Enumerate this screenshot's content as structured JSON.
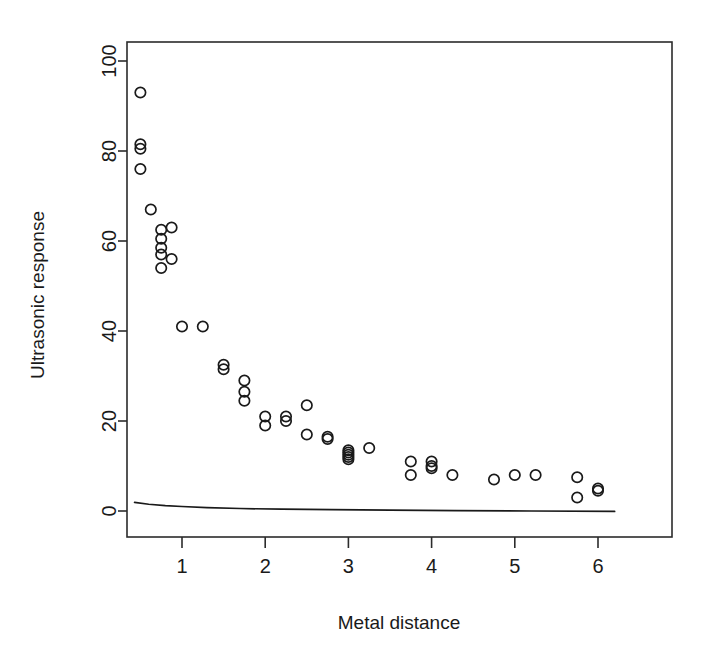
{
  "chart_data": {
    "type": "scatter",
    "title": "",
    "xlabel": "Metal distance",
    "ylabel": "Ultrasonic response",
    "xlim": [
      0.3,
      6.35
    ],
    "ylim": [
      -3,
      104
    ],
    "grid": false,
    "legend": null,
    "xticks": [
      1,
      2,
      3,
      4,
      5,
      6
    ],
    "xtick_labels": [
      "1",
      "2",
      "3",
      "4",
      "5",
      "6"
    ],
    "yticks": [
      0,
      20,
      40,
      60,
      80,
      100
    ],
    "ytick_labels": [
      "0",
      "20",
      "40",
      "60",
      "80",
      "100"
    ],
    "marker": "open-circle",
    "point_color": "#1a1a1a",
    "series": [
      {
        "name": "observations",
        "x": [
          0.5,
          0.5,
          0.5,
          0.5,
          0.625,
          0.75,
          0.75,
          0.75,
          0.75,
          0.75,
          0.875,
          0.875,
          1.0,
          1.25,
          1.5,
          1.5,
          1.75,
          1.75,
          1.75,
          2.0,
          2.0,
          2.25,
          2.25,
          2.5,
          2.5,
          2.75,
          2.75,
          3.0,
          3.0,
          3.0,
          3.0,
          3.0,
          3.25,
          3.75,
          3.75,
          4.0,
          4.0,
          4.0,
          4.25,
          4.75,
          5.0,
          5.25,
          5.75,
          5.75,
          6.0,
          6.0
        ],
        "y": [
          93.0,
          81.5,
          80.5,
          76.0,
          67.0,
          62.5,
          60.5,
          58.5,
          57.0,
          54.0,
          63.0,
          56.0,
          41.0,
          41.0,
          32.5,
          31.5,
          29.0,
          26.5,
          24.5,
          21.0,
          19.0,
          21.0,
          20.0,
          23.5,
          17.0,
          16.5,
          16.0,
          13.5,
          13.0,
          12.5,
          12.0,
          11.5,
          14.0,
          11.0,
          8.0,
          11.0,
          10.0,
          9.5,
          8.0,
          7.0,
          8.0,
          8.0,
          7.5,
          3.0,
          5.0,
          4.5
        ]
      }
    ],
    "fit_curve": {
      "name": "fitted-curve",
      "x": [
        0.43,
        0.6,
        0.8,
        1.0,
        1.3,
        1.7,
        2.2,
        2.8,
        3.5,
        4.3,
        5.2,
        6.2
      ],
      "y": [
        1.9,
        1.5,
        1.2,
        1.0,
        0.75,
        0.55,
        0.4,
        0.3,
        0.2,
        0.1,
        0.0,
        -0.1
      ]
    }
  }
}
